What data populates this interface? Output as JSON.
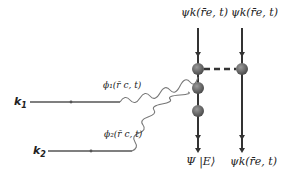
{
  "diagram": {
    "inputs": [
      {
        "id": "k1",
        "label": "k",
        "subscript": "1"
      },
      {
        "id": "k2",
        "label": "k",
        "subscript": "2"
      }
    ],
    "photon_labels": [
      {
        "id": "phi1",
        "text": "ϕ₁(r⃗_c, t)",
        "display": "ϕ₁(r̄ c, t)"
      },
      {
        "id": "phi2",
        "text": "ϕ₂(r⃗_c, t)",
        "display": "ϕ₂(r̄ c, t)"
      }
    ],
    "top_labels": [
      {
        "id": "psi_top_left",
        "display": "ψk(r̄e, t)"
      },
      {
        "id": "psi_top_right",
        "display": "ψk(r̄e, t)"
      }
    ],
    "bottom_labels": [
      {
        "id": "Psi_E",
        "display": "Ψ |E⟩"
      },
      {
        "id": "psi_bottom_right",
        "display": "ψk(r̄e, t)"
      }
    ],
    "colors": {
      "line": "#333333",
      "input_line": "#555555",
      "wavy": "#777777",
      "node": "#666666"
    }
  }
}
